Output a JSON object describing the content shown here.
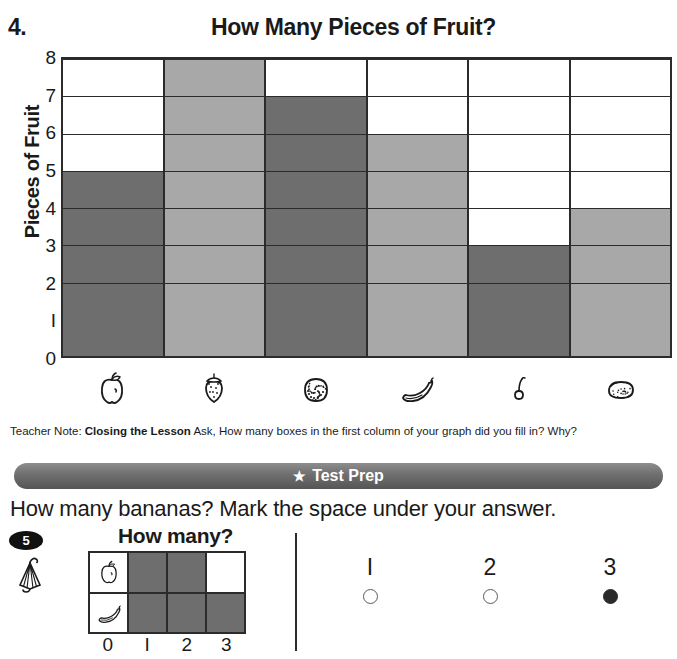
{
  "top_cut_text": "",
  "problem": {
    "number": "4.",
    "title": "How Many Pieces of Fruit?"
  },
  "chart_data": {
    "type": "bar",
    "title": "How Many Pieces of Fruit?",
    "xlabel": "",
    "ylabel": "Pieces of Fruit",
    "ylim": [
      0,
      8
    ],
    "grid": true,
    "legend": "none",
    "categories": [
      "apple",
      "strawberry",
      "orange",
      "banana",
      "cherry",
      "lemon"
    ],
    "category_icons": [
      "apple-icon",
      "strawberry-icon",
      "orange-icon",
      "banana-icon",
      "cherry-icon",
      "lemon-icon"
    ],
    "values": [
      5,
      8,
      7,
      6,
      3,
      4
    ],
    "bar_colors": [
      "#6e6e6e",
      "#a8a8a8",
      "#6e6e6e",
      "#a8a8a8",
      "#6e6e6e",
      "#a8a8a8"
    ],
    "y_ticks": [
      "0",
      "1",
      "2",
      "3",
      "4",
      "5",
      "6",
      "7",
      "8"
    ],
    "y_tick_display": [
      "0",
      "I",
      "2",
      "3",
      "4",
      "5",
      "6",
      "7",
      "8"
    ]
  },
  "teacher_note": {
    "prefix": "Teacher Note: ",
    "bold": "Closing the Lesson",
    "body": " Ask, How many boxes in the first column of your graph did you fill in? Why?"
  },
  "test_prep": {
    "star": "★",
    "banner_label": "Test Prep",
    "banner_color": "#6f6f6f",
    "question": "How many bananas? Mark the space under your answer."
  },
  "item5": {
    "badge": "5",
    "icon": "umbrella-icon",
    "mini_chart": {
      "type": "bar",
      "title": "How many?",
      "categories": [
        "apple",
        "banana"
      ],
      "category_icons": [
        "apple-icon",
        "banana-icon"
      ],
      "values": [
        2,
        3
      ],
      "max": 3,
      "axis_labels": [
        "0",
        "I",
        "2",
        "3"
      ],
      "fill_color": "#6e6e6e"
    },
    "answers": [
      {
        "label": "I",
        "value": "1",
        "selected": false
      },
      {
        "label": "2",
        "value": "2",
        "selected": false
      },
      {
        "label": "3",
        "value": "3",
        "selected": true
      }
    ]
  }
}
